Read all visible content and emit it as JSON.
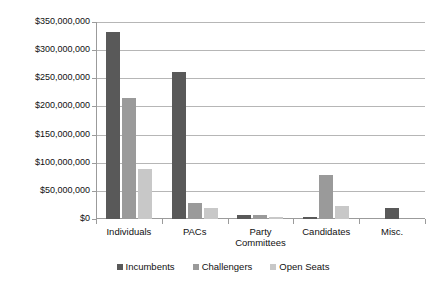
{
  "chart_data": {
    "type": "bar",
    "title": "",
    "xlabel": "",
    "ylabel": "",
    "categories": [
      "Individuals",
      "PACs",
      "Party Committees",
      "Candidates",
      "Misc."
    ],
    "series": [
      {
        "name": "Incumbents",
        "color": "#595959",
        "values": [
          333000000,
          261000000,
          7000000,
          4000000,
          20000000
        ]
      },
      {
        "name": "Challengers",
        "color": "#9a9a9a",
        "values": [
          215000000,
          28000000,
          8000000,
          78000000,
          0
        ]
      },
      {
        "name": "Open Seats",
        "color": "#c8c8c8",
        "values": [
          88000000,
          20000000,
          3000000,
          24000000,
          0
        ]
      }
    ],
    "ylim": [
      0,
      350000000
    ],
    "ytick_step": 50000000,
    "ytick_labels": [
      "$0",
      "$50,000,000",
      "$100,000,000",
      "$150,000,000",
      "$200,000,000",
      "$250,000,000",
      "$300,000,000",
      "$350,000,000"
    ],
    "grid": true,
    "legend_position": "bottom"
  }
}
